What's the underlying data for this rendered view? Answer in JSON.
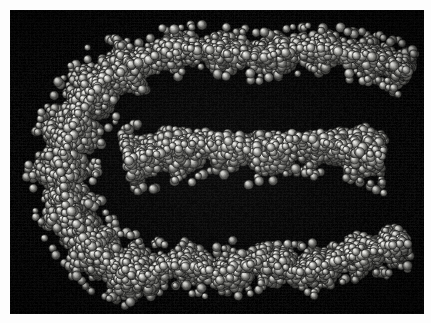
{
  "figure": {
    "kind": "molecular-space-filling-model",
    "title": "Space-filling (CPK) molecular model",
    "render_style": "CPK space-filling spheres, single grayscale material, single light source from upper-left",
    "background_color": "#050505",
    "page_color": "#fdfdfd",
    "atom_color_light": "#e8e8e4",
    "atom_color_mid": "#9a9a96",
    "atom_color_dark": "#2e2e2c",
    "specular_color": "#ffffff",
    "plate": {
      "x": 10,
      "y": 10,
      "width": 414,
      "height": 304
    },
    "light_direction": "upper-left",
    "atom_radius_px": {
      "min": 3.1,
      "max": 5.2
    },
    "approx_atom_count": 1850
  },
  "chart_data": {
    "type": "scatter",
    "title": "Space-filling (CPK) molecular model",
    "xlabel": "",
    "ylabel": "",
    "xlim": [
      0,
      414
    ],
    "ylim": [
      0,
      304
    ],
    "grid": false,
    "legend": null,
    "regions": [
      {
        "name": "upper-arm",
        "label": "Upper strand arm",
        "spine": [
          [
            120,
            58
          ],
          [
            160,
            42
          ],
          [
            205,
            40
          ],
          [
            250,
            46
          ],
          [
            295,
            38
          ],
          [
            340,
            44
          ],
          [
            378,
            52
          ],
          [
            398,
            62
          ]
        ],
        "thickness": 34,
        "density": 0.92
      },
      {
        "name": "left-lobe",
        "label": "Dense left-hand lobe",
        "spine": [
          [
            122,
            56
          ],
          [
            92,
            72
          ],
          [
            70,
            100
          ],
          [
            56,
            135
          ],
          [
            52,
            165
          ],
          [
            60,
            200
          ],
          [
            78,
            232
          ],
          [
            104,
            256
          ],
          [
            134,
            268
          ]
        ],
        "thickness": 54,
        "density": 1.0
      },
      {
        "name": "middle-arm",
        "label": "Central strand arm",
        "spine": [
          [
            118,
            150
          ],
          [
            160,
            140
          ],
          [
            205,
            132
          ],
          [
            250,
            140
          ],
          [
            292,
            128
          ],
          [
            330,
            136
          ],
          [
            370,
            146
          ],
          [
            398,
            158
          ]
        ],
        "thickness": 52,
        "density": 0.98
      },
      {
        "name": "lower-arm",
        "label": "Lower strand arm",
        "spine": [
          [
            132,
            266
          ],
          [
            172,
            252
          ],
          [
            212,
            264
          ],
          [
            252,
            250
          ],
          [
            292,
            262
          ],
          [
            330,
            248
          ],
          [
            368,
            240
          ],
          [
            396,
            232
          ]
        ],
        "thickness": 36,
        "density": 0.93
      }
    ],
    "voids": [
      {
        "name": "upper-groove",
        "label": "Upper groove (dark gap)",
        "center": [
          250,
          98
        ],
        "rx": 150,
        "ry": 26
      },
      {
        "name": "lower-groove",
        "label": "Lower groove (dark gap)",
        "center": [
          258,
          205
        ],
        "rx": 140,
        "ry": 26
      },
      {
        "name": "right-mouth",
        "label": "Open right-hand mouth",
        "center": [
          410,
          160
        ],
        "rx": 38,
        "ry": 70
      }
    ]
  }
}
